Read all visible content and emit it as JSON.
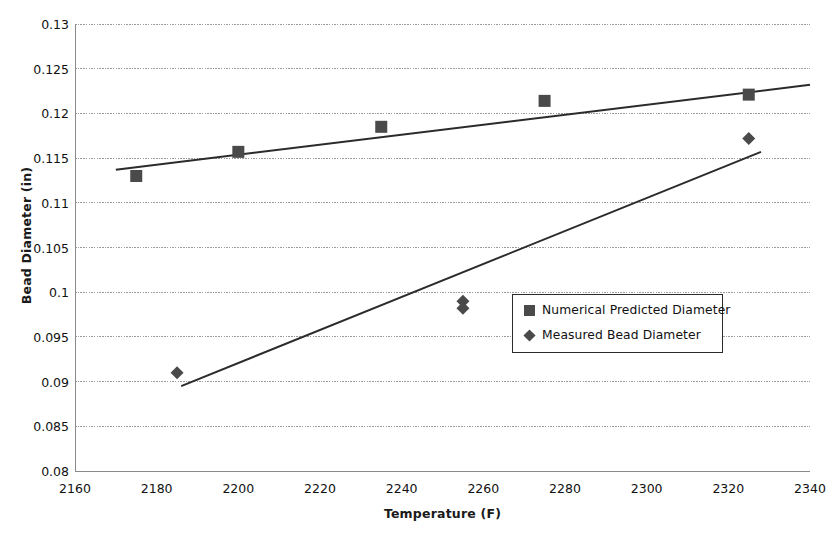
{
  "chart_data": {
    "type": "scatter",
    "title": "",
    "xlabel": "Temperature (F)",
    "ylabel": "Bead Diameter (in)",
    "xlim": [
      2160,
      2340
    ],
    "ylim": [
      0.08,
      0.13
    ],
    "xticks": [
      "2160",
      "2180",
      "2200",
      "2220",
      "2240",
      "2260",
      "2280",
      "2300",
      "2320",
      "2340"
    ],
    "xtick_values": [
      2160,
      2180,
      2200,
      2220,
      2240,
      2260,
      2280,
      2300,
      2320,
      2340
    ],
    "yticks": [
      "0.08",
      "0.085",
      "0.09",
      "0.095",
      "0.1",
      "0.105",
      "0.11",
      "0.115",
      "0.12",
      "0.125",
      "0.13"
    ],
    "ytick_values": [
      0.08,
      0.085,
      0.09,
      0.095,
      0.1,
      0.105,
      0.11,
      0.115,
      0.12,
      0.125,
      0.13
    ],
    "grid": "horizontal",
    "legend_position": "center-right-inside",
    "marker_color": "#4a4a4a",
    "trendline_color": "#2b2b2b",
    "gridline_color": "#9b9b9b",
    "series": [
      {
        "name": "Numerical Predicted Diameter",
        "marker": "square",
        "points": [
          {
            "x": 2175,
            "y": 0.113
          },
          {
            "x": 2200,
            "y": 0.1157
          },
          {
            "x": 2235,
            "y": 0.1185
          },
          {
            "x": 2275,
            "y": 0.1214
          },
          {
            "x": 2325,
            "y": 0.1221
          }
        ],
        "trendline": {
          "x0": 2170,
          "y0": 0.1137,
          "x1": 2340,
          "y1": 0.1232
        }
      },
      {
        "name": "Measured Bead Diameter",
        "marker": "diamond",
        "points": [
          {
            "x": 2185,
            "y": 0.091
          },
          {
            "x": 2255,
            "y": 0.099
          },
          {
            "x": 2255,
            "y": 0.0982
          },
          {
            "x": 2325,
            "y": 0.1172
          }
        ],
        "trendline": {
          "x0": 2186,
          "y0": 0.0895,
          "x1": 2328,
          "y1": 0.1157
        }
      }
    ]
  },
  "legend": {
    "entries": [
      {
        "label": "Numerical Predicted Diameter",
        "marker": "square"
      },
      {
        "label": "Measured Bead Diameter",
        "marker": "diamond"
      }
    ]
  }
}
